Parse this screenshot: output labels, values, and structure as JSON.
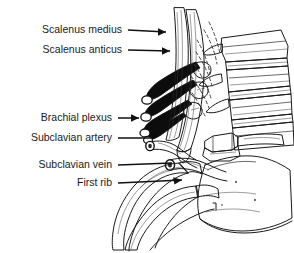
{
  "figure": {
    "background_color": "#ffffff",
    "ink_color": "#1a1a1a",
    "width": 294,
    "height": 253
  },
  "labels": [
    {
      "id": "scalenus-medius",
      "text": "Scalenus medius",
      "text_x": 122,
      "text_y": 30,
      "leader_x1": 128,
      "leader_y1": 30,
      "leader_x2": 172,
      "leader_y2": 32,
      "arrow": true
    },
    {
      "id": "scalenus-anticus",
      "text": "Scalenus anticus",
      "text_x": 122,
      "text_y": 50,
      "leader_x1": 128,
      "leader_y1": 50,
      "leader_x2": 176,
      "leader_y2": 51,
      "arrow": true
    },
    {
      "id": "brachial-plexus",
      "text": "Brachial plexus",
      "text_x": 112,
      "text_y": 118,
      "leader_x1": 118,
      "leader_y1": 118,
      "leader_x2": 145,
      "leader_y2": 118,
      "arrow": true
    },
    {
      "id": "subclavian-artery",
      "text": "Subclavian artery",
      "text_x": 112,
      "text_y": 138,
      "leader_x1": 118,
      "leader_y1": 138,
      "leader_x2": 150,
      "leader_y2": 138,
      "arrow": false
    },
    {
      "id": "subclavian-vein",
      "text": "Subclavian vein",
      "text_x": 112,
      "text_y": 165,
      "leader_x1": 118,
      "leader_y1": 165,
      "leader_x2": 168,
      "leader_y2": 163,
      "arrow": false
    },
    {
      "id": "first-rib",
      "text": "First rib",
      "text_x": 112,
      "text_y": 183,
      "leader_x1": 118,
      "leader_y1": 183,
      "leader_x2": 182,
      "leader_y2": 180,
      "arrow": true
    }
  ],
  "structures": [
    {
      "id": "scalenus-medius-muscle",
      "name": "Scalenus medius muscle"
    },
    {
      "id": "scalenus-anticus-muscle",
      "name": "Scalenus anticus muscle"
    },
    {
      "id": "brachial-plexus-trunks",
      "name": "Brachial plexus nerve trunks"
    },
    {
      "id": "subclavian-artery-vessel",
      "name": "Subclavian artery"
    },
    {
      "id": "subclavian-vein-vessel",
      "name": "Subclavian vein"
    },
    {
      "id": "first-rib-bone",
      "name": "First rib"
    },
    {
      "id": "second-rib-bone",
      "name": "Second rib"
    },
    {
      "id": "cervical-vertebrae",
      "name": "Cervical vertebral bodies"
    },
    {
      "id": "clavicle-bone",
      "name": "Clavicle"
    },
    {
      "id": "sternum-manubrium",
      "name": "Manubrium of sternum"
    }
  ]
}
